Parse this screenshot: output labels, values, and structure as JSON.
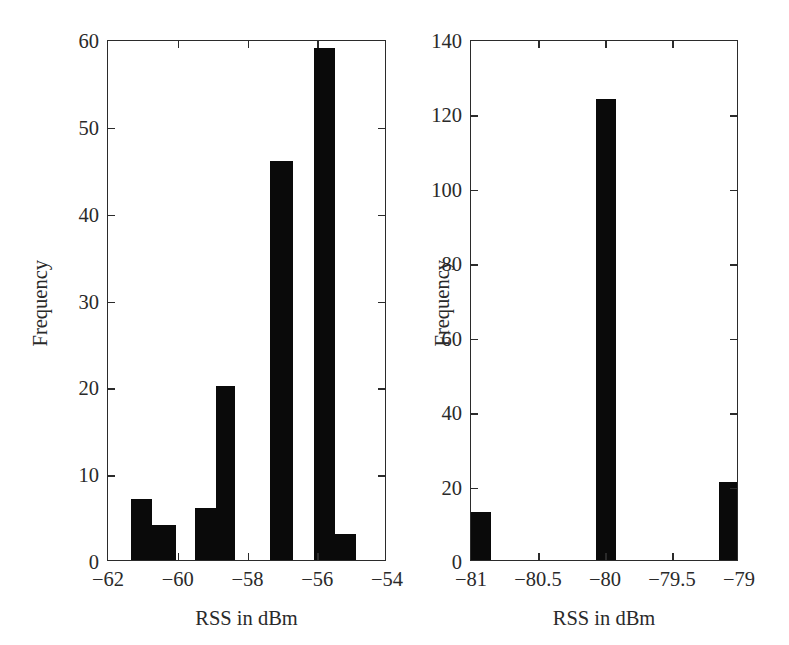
{
  "figure": {
    "background": "#ffffff",
    "ink_color": "#0a0a0a",
    "axis_color": "#2b2b2b",
    "panel_count": 2
  },
  "chart_data": [
    {
      "id": "left-histogram",
      "type": "bar",
      "title": "",
      "xlabel": "RSS in dBm",
      "ylabel": "Frequency",
      "xlim": [
        -62,
        -54
      ],
      "ylim": [
        0,
        60
      ],
      "xticks": [
        -62,
        -60,
        -58,
        -56,
        -54
      ],
      "xticklabels": [
        "−62",
        "−60",
        "−58",
        "−56",
        "−54"
      ],
      "yticks": [
        0,
        10,
        20,
        30,
        40,
        50,
        60
      ],
      "yticklabels": [
        "0",
        "10",
        "20",
        "30",
        "40",
        "50",
        "60"
      ],
      "grid": false,
      "legend": null,
      "bin_width": 0.6,
      "bins": [
        {
          "left": -61.35,
          "right": -60.75,
          "value": 7
        },
        {
          "left": -60.75,
          "right": -60.05,
          "value": 4
        },
        {
          "left": -59.5,
          "right": -58.9,
          "value": 6
        },
        {
          "left": -58.9,
          "right": -58.35,
          "value": 20
        },
        {
          "left": -57.35,
          "right": -56.7,
          "value": 46
        },
        {
          "left": -56.1,
          "right": -55.5,
          "value": 59
        },
        {
          "left": -55.5,
          "right": -54.9,
          "value": 3
        }
      ],
      "categories": [
        "-61.35",
        "-60.75",
        "-59.50",
        "-58.90",
        "-57.35",
        "-56.10",
        "-55.50"
      ],
      "values": [
        7,
        4,
        6,
        20,
        46,
        59,
        3
      ]
    },
    {
      "id": "right-histogram",
      "type": "bar",
      "title": "",
      "xlabel": "RSS in dBm",
      "ylabel": "Frequency",
      "xlim": [
        -81,
        -79
      ],
      "ylim": [
        0,
        140
      ],
      "xticks": [
        -81,
        -80.5,
        -80,
        -79.5,
        -79
      ],
      "xticklabels": [
        "−81",
        "−80.5",
        "−80",
        "−79.5",
        "−79"
      ],
      "yticks": [
        0,
        20,
        40,
        60,
        80,
        100,
        120,
        140
      ],
      "yticklabels": [
        "0",
        "20",
        "40",
        "60",
        "80",
        "100",
        "120",
        "140"
      ],
      "grid": false,
      "legend": null,
      "bin_width": 0.15,
      "bins": [
        {
          "left": -81.0,
          "right": -80.85,
          "value": 13
        },
        {
          "left": -80.07,
          "right": -79.92,
          "value": 124
        },
        {
          "left": -79.15,
          "right": -79.0,
          "value": 21
        }
      ],
      "categories": [
        "-81",
        "-80",
        "-79"
      ],
      "values": [
        13,
        124,
        21
      ]
    }
  ],
  "panels": {
    "left": {
      "name": "left-panel",
      "xlabel": "RSS in dBm",
      "ylabel": "Frequency"
    },
    "right": {
      "name": "right-panel",
      "xlabel": "RSS in dBm",
      "ylabel": "Frequency"
    }
  }
}
